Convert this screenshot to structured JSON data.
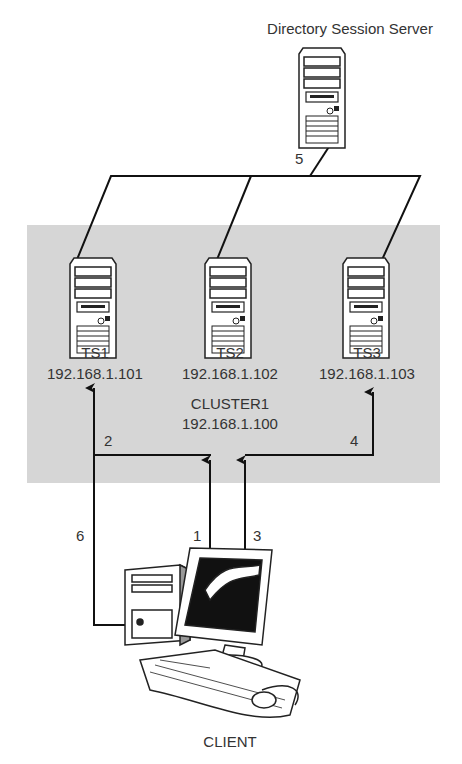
{
  "title": "Directory Session Server",
  "cluster": {
    "name": "CLUSTER1",
    "ip": "192.168.1.100",
    "color": "#d6d6d6"
  },
  "servers": [
    {
      "name": "TS1",
      "ip": "192.168.1.101"
    },
    {
      "name": "TS2",
      "ip": "192.168.1.102"
    },
    {
      "name": "TS3",
      "ip": "192.168.1.103"
    }
  ],
  "client": {
    "label": "CLIENT"
  },
  "steps": [
    "1",
    "2",
    "3",
    "4",
    "5",
    "6"
  ]
}
